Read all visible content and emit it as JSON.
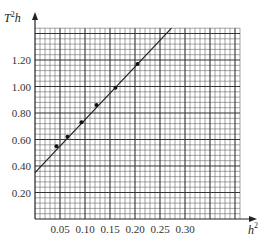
{
  "chart_data": {
    "type": "scatter",
    "title": "",
    "xlabel": "h²",
    "ylabel": "T²h",
    "xlim": [
      0,
      0.41
    ],
    "ylim": [
      0,
      1.44
    ],
    "grid": true,
    "legend": null,
    "x_ticks": [
      0.05,
      0.1,
      0.15,
      0.2,
      0.25,
      0.3
    ],
    "x_tick_labels": [
      "0.05",
      "0.10",
      "0.15",
      "0.20",
      "0.25",
      "0.30"
    ],
    "y_ticks": [
      0.2,
      0.4,
      0.6,
      0.8,
      1.0,
      1.2
    ],
    "y_tick_labels": [
      "0.20",
      "0.40",
      "0.60",
      "0.80",
      "1.00",
      "1.20"
    ],
    "series": [
      {
        "name": "measured points",
        "x": [
          0.043,
          0.065,
          0.093,
          0.123,
          0.161,
          0.205
        ],
        "y": [
          0.55,
          0.62,
          0.73,
          0.86,
          0.99,
          1.17
        ]
      }
    ],
    "fit_line": {
      "name": "best-fit line",
      "x": [
        0.0,
        0.273
      ],
      "y": [
        0.35,
        1.44
      ]
    }
  },
  "labels": {
    "x_axis_main": "h",
    "x_axis_sup": "2",
    "y_axis_main_T": "T",
    "y_axis_sup": "2",
    "y_axis_main_h": "h"
  }
}
